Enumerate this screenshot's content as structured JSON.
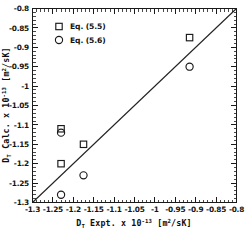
{
  "chart_data": {
    "type": "scatter",
    "title": "",
    "xlabel": "D_T Expt. x 10^-13 [m^2/sK]",
    "ylabel": "D_T Calc. x 10^-13 [m^2/sK]",
    "xlim": [
      -1.3,
      -0.8
    ],
    "ylim": [
      -1.3,
      -0.8
    ],
    "xticks": [
      -1.3,
      -1.25,
      -1.2,
      -1.15,
      -1.1,
      -1.05,
      -1,
      -0.95,
      -0.9,
      -0.85,
      -0.8
    ],
    "yticks": [
      -1.3,
      -1.25,
      -1.2,
      -1.15,
      -1.1,
      -1.05,
      -1,
      -0.95,
      -0.9,
      -0.85,
      -0.8
    ],
    "xtick_labels": [
      "-1.3",
      "-1.25",
      "-1.2",
      "-1.15",
      "-1.1",
      "-1.05",
      "-1",
      "-0.95",
      "-0.9",
      "-0.85",
      "-0.8"
    ],
    "ytick_labels": [
      "-1.3",
      "-1.25",
      "-1.2",
      "-1.15",
      "-1.1",
      "-1.05",
      "-1",
      "-0.95",
      "-0.9",
      "-0.85",
      "-0.8"
    ],
    "minor_ticks_per_interval": 5,
    "grid": false,
    "legend_position": "upper-left",
    "reference_line": {
      "name": "parity-line",
      "type": "line",
      "x": [
        -1.3,
        -0.8
      ],
      "y": [
        -1.3,
        -0.8
      ]
    },
    "series": [
      {
        "name": "Eq. (5.5)",
        "marker": "square",
        "points": [
          {
            "x": -1.23,
            "y": -1.11
          },
          {
            "x": -1.175,
            "y": -1.15
          },
          {
            "x": -1.23,
            "y": -1.2
          },
          {
            "x": -0.915,
            "y": -0.875
          }
        ]
      },
      {
        "name": "Eq. (5.6)",
        "marker": "circle",
        "points": [
          {
            "x": -1.23,
            "y": -1.12
          },
          {
            "x": -1.175,
            "y": -1.23
          },
          {
            "x": -1.23,
            "y": -1.28
          },
          {
            "x": -0.915,
            "y": -0.95
          }
        ]
      }
    ]
  },
  "axes": {
    "x_title": {
      "symbol": "D",
      "subscript": "T",
      "name": " Expt. x 10",
      "exponent": "-13",
      "units": " [m",
      "unit_sup": "2",
      "units_tail": "/sK]"
    },
    "y_title": {
      "symbol": "D",
      "subscript": "T",
      "name": " Calc. x 10",
      "exponent": "-13",
      "units": " [m",
      "unit_sup": "2",
      "units_tail": "/sK]"
    }
  },
  "legend": {
    "entries": [
      {
        "label": "Eq. (5.5)",
        "marker": "square-marker"
      },
      {
        "label": "Eq. (5.6)",
        "marker": "circle-marker"
      }
    ]
  },
  "colors": {
    "axis": "#1a1a1a",
    "marker": "#1a1a1a",
    "line": "#222222",
    "background": "#ffffff",
    "text": "#111111"
  }
}
